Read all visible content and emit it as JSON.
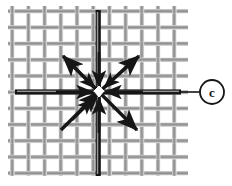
{
  "figure": {
    "type": "technical-diagram",
    "background_color": "#ffffff",
    "mesh": {
      "label": "woven wire mesh",
      "x": 8,
      "y": 6,
      "width": 180,
      "height": 170,
      "pitch": 16.2,
      "wire_width": 4.6,
      "wire_color_light": "#c9c9c9",
      "wire_color_mid": "#9a9a9a",
      "wire_color_dark": "#6f6f6f",
      "warp_count": 11,
      "weft_count": 11
    },
    "center": {
      "label": "load application point",
      "x": 99,
      "y": 92,
      "node_color": "#ffffff"
    },
    "axes": [
      {
        "name": "vertical-axis-wire",
        "orientation": "vertical",
        "x": 98,
        "y1": 10,
        "y2": 176,
        "color": "#141414",
        "width": 5
      },
      {
        "name": "horizontal-axis-wire",
        "orientation": "horizontal",
        "y": 92,
        "x1": 15,
        "x2": 181,
        "color": "#141414",
        "width": 5
      }
    ],
    "vectors": [
      {
        "name": "vector-up-left",
        "angle_deg": 225,
        "x2": 63,
        "y2": 56,
        "arrow": "outward",
        "color": "#161616"
      },
      {
        "name": "vector-up-right",
        "angle_deg": 315,
        "x2": 139,
        "y2": 56,
        "arrow": "outward",
        "color": "#161616"
      },
      {
        "name": "vector-down-left",
        "angle_deg": 135,
        "x2": 61,
        "y2": 130,
        "arrow": "inward",
        "color": "#161616"
      },
      {
        "name": "vector-down-right",
        "angle_deg": 45,
        "x2": 137,
        "y2": 130,
        "arrow": "outward",
        "color": "#161616"
      },
      {
        "name": "vector-up",
        "angle_deg": 270,
        "x2": 99,
        "y2": 50,
        "arrow": "inward",
        "color": "#161616"
      },
      {
        "name": "vector-down",
        "angle_deg": 90,
        "x2": 99,
        "y2": 134,
        "arrow": "inward",
        "color": "#161616"
      },
      {
        "name": "vector-left",
        "angle_deg": 180,
        "x2": 55,
        "y2": 92,
        "arrow": "inward",
        "color": "#161616"
      },
      {
        "name": "vector-right",
        "angle_deg": 0,
        "x2": 143,
        "y2": 92,
        "arrow": "inward",
        "color": "#161616"
      }
    ],
    "callout": {
      "name": "callout-c",
      "text": "c",
      "circle_cx": 212,
      "circle_cy": 92,
      "circle_r": 12,
      "leader_x1": 181,
      "leader_x2": 200,
      "leader_y": 92,
      "stroke_color": "#161616",
      "text_color": "#161616",
      "fill_color": "#ffffff"
    }
  }
}
